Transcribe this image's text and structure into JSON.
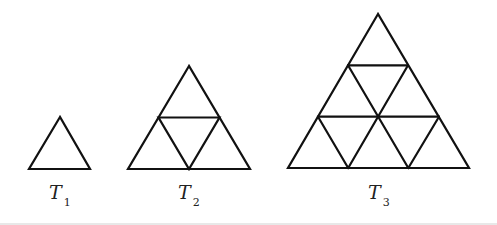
{
  "figure": {
    "items": [
      {
        "name": "T",
        "sub": "1",
        "subdivisions": 1,
        "small_triangles": 1
      },
      {
        "name": "T",
        "sub": "2",
        "subdivisions": 2,
        "small_triangles": 4
      },
      {
        "name": "T",
        "sub": "3",
        "subdivisions": 3,
        "small_triangles": 9
      }
    ]
  },
  "colors": {
    "line": "#111111",
    "background": "#ffffff"
  }
}
